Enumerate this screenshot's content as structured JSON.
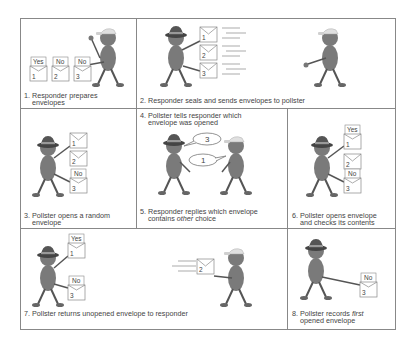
{
  "diagram": {
    "colors": {
      "figure_body": "#7a7a7a",
      "hat_dark": "#555555",
      "cap_light": "#e0e0e0",
      "border": "#888888",
      "text": "#444444"
    },
    "panels": [
      {
        "id": 1,
        "caption": "1. Responder prepares envelopes",
        "caption_lines": [
          "1. Responder prepares",
          "envelopes"
        ],
        "characters": [
          "responder"
        ],
        "envelopes": [
          {
            "number": "1",
            "content": "Yes",
            "state": "open"
          },
          {
            "number": "2",
            "content": "No",
            "state": "open"
          },
          {
            "number": "3",
            "content": "No",
            "state": "open"
          }
        ]
      },
      {
        "id": 2,
        "caption": "2. Responder seals and sends envelopes to pollster",
        "caption_lines": [
          "2. Responder seals and sends envelopes to pollster"
        ],
        "characters": [
          "pollster",
          "responder"
        ],
        "envelopes": [
          {
            "number": "1",
            "state": "sealed"
          },
          {
            "number": "2",
            "state": "sealed"
          },
          {
            "number": "3",
            "state": "sealed"
          }
        ]
      },
      {
        "id": 3,
        "caption": "3. Pollster opens a random envelope",
        "caption_lines": [
          "3. Pollster opens a random",
          "envelope"
        ],
        "characters": [
          "pollster"
        ],
        "envelopes": [
          {
            "number": "1",
            "state": "sealed"
          },
          {
            "number": "2",
            "state": "sealed"
          },
          {
            "number": "3",
            "content": "No",
            "state": "open"
          }
        ]
      },
      {
        "id": 4,
        "caption": "4. Pollster tells responder which envelope was opened",
        "caption_lines": [
          "4. Pollster tells responder which",
          "envelope was opened"
        ],
        "speech": "3"
      },
      {
        "id": 5,
        "caption": "5. Responder replies which envelope contains other choice",
        "caption_lines": [
          "5. Responder replies which envelope",
          "contains ",
          "other",
          " choice"
        ],
        "speech": "1",
        "emphasis": "other"
      },
      {
        "id": 6,
        "caption": "6. Pollster opens envelope and checks its contents",
        "caption_lines": [
          "6. Pollster opens envelope",
          "and checks its contents"
        ],
        "characters": [
          "pollster"
        ],
        "envelopes": [
          {
            "number": "1",
            "content": "Yes",
            "state": "open"
          },
          {
            "number": "2",
            "state": "sealed"
          },
          {
            "number": "3",
            "content": "No",
            "state": "open"
          }
        ]
      },
      {
        "id": 7,
        "caption": "7. Pollster returns unopened envelope to responder",
        "caption_lines": [
          "7. Pollster returns unopened envelope to responder"
        ],
        "characters": [
          "pollster",
          "responder"
        ],
        "envelopes": [
          {
            "number": "1",
            "content": "Yes",
            "state": "open"
          },
          {
            "number": "3",
            "content": "No",
            "state": "open"
          },
          {
            "number": "2",
            "state": "sealed",
            "moving": true
          }
        ]
      },
      {
        "id": 8,
        "caption": "8. Pollster records first opened envelope",
        "caption_lines": [
          "8. Pollster records ",
          "first",
          "opened envelope"
        ],
        "characters": [
          "pollster"
        ],
        "envelopes": [
          {
            "number": "3",
            "content": "No",
            "state": "open"
          }
        ],
        "emphasis": "first"
      }
    ]
  }
}
